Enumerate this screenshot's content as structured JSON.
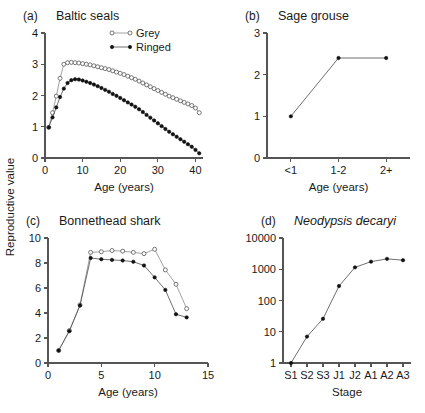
{
  "figure": {
    "shared_ylabel": "Reproductive value",
    "width": 425,
    "height": 413
  },
  "chart_data": [
    {
      "id": "a",
      "type": "line",
      "panel_letter": "(a)",
      "title": "Baltic seals",
      "title_italic": false,
      "xlabel": "Age (years)",
      "ylabel": "",
      "xlim": [
        0,
        42
      ],
      "ylim": [
        0,
        4
      ],
      "xticks": [
        0,
        10,
        20,
        30,
        40
      ],
      "xticklabels": [
        "0",
        "10",
        "20",
        "30",
        "40"
      ],
      "yticks": [
        0,
        1,
        2,
        3,
        4
      ],
      "yticklabels": [
        "0",
        "1",
        "2",
        "3",
        "4"
      ],
      "grid": false,
      "legend_position": "top-right",
      "series": [
        {
          "name": "Grey",
          "marker": "open-circle",
          "x": [
            1,
            2,
            3,
            4,
            5,
            6,
            7,
            8,
            9,
            10,
            11,
            12,
            13,
            14,
            15,
            16,
            17,
            18,
            19,
            20,
            21,
            22,
            23,
            24,
            25,
            26,
            27,
            28,
            29,
            30,
            31,
            32,
            33,
            34,
            35,
            36,
            37,
            38,
            39,
            40,
            41
          ],
          "values": [
            0.98,
            1.45,
            1.98,
            2.55,
            3.0,
            3.05,
            3.06,
            3.05,
            3.04,
            3.02,
            3.0,
            2.98,
            2.95,
            2.92,
            2.89,
            2.86,
            2.83,
            2.79,
            2.75,
            2.71,
            2.67,
            2.62,
            2.57,
            2.52,
            2.46,
            2.4,
            2.34,
            2.28,
            2.22,
            2.16,
            2.1,
            2.04,
            1.98,
            1.93,
            1.88,
            1.83,
            1.78,
            1.73,
            1.68,
            1.6,
            1.45
          ]
        },
        {
          "name": "Ringed",
          "marker": "filled-circle",
          "x": [
            1,
            2,
            3,
            4,
            5,
            6,
            7,
            8,
            9,
            10,
            11,
            12,
            13,
            14,
            15,
            16,
            17,
            18,
            19,
            20,
            21,
            22,
            23,
            24,
            25,
            26,
            27,
            28,
            29,
            30,
            31,
            32,
            33,
            34,
            35,
            36,
            37,
            38,
            39,
            40,
            41
          ],
          "values": [
            0.98,
            1.3,
            1.62,
            1.95,
            2.22,
            2.4,
            2.49,
            2.52,
            2.51,
            2.48,
            2.44,
            2.4,
            2.35,
            2.3,
            2.24,
            2.18,
            2.12,
            2.05,
            1.99,
            1.92,
            1.85,
            1.78,
            1.71,
            1.64,
            1.56,
            1.47,
            1.38,
            1.29,
            1.2,
            1.11,
            1.02,
            0.93,
            0.84,
            0.76,
            0.68,
            0.6,
            0.52,
            0.44,
            0.36,
            0.26,
            0.15
          ]
        }
      ]
    },
    {
      "id": "b",
      "type": "line",
      "panel_letter": "(b)",
      "title": "Sage grouse",
      "title_italic": false,
      "xlabel": "Age (years)",
      "ylabel": "",
      "ylim": [
        0,
        3
      ],
      "yticks": [
        0,
        1,
        2,
        3
      ],
      "yticklabels": [
        "0",
        "1",
        "2",
        "3"
      ],
      "categories": [
        "<1",
        "1-2",
        "2+"
      ],
      "grid": false,
      "series": [
        {
          "name": "Sage grouse",
          "marker": "filled-circle",
          "values": [
            1.0,
            2.4,
            2.4
          ]
        }
      ]
    },
    {
      "id": "c",
      "type": "line",
      "panel_letter": "(c)",
      "title": "Bonnethead shark",
      "title_italic": false,
      "xlabel": "Age (years)",
      "ylabel": "",
      "xlim": [
        0,
        15
      ],
      "ylim": [
        0,
        10
      ],
      "xticks": [
        0,
        5,
        10,
        15
      ],
      "xticklabels": [
        "0",
        "5",
        "10",
        "15"
      ],
      "yticks": [
        0,
        2,
        4,
        6,
        8,
        10
      ],
      "yticklabels": [
        "0",
        "2",
        "4",
        "6",
        "8",
        "10"
      ],
      "grid": false,
      "series": [
        {
          "name": "open",
          "marker": "open-circle",
          "x": [
            1,
            2,
            3,
            4,
            5,
            6,
            7,
            8,
            9,
            10,
            11,
            12,
            13
          ],
          "values": [
            1.0,
            2.6,
            4.65,
            8.85,
            8.9,
            9.0,
            8.95,
            8.85,
            8.75,
            9.1,
            7.45,
            6.3,
            4.35
          ]
        },
        {
          "name": "filled",
          "marker": "filled-circle",
          "x": [
            1,
            2,
            3,
            4,
            5,
            6,
            7,
            8,
            9,
            10,
            11,
            12,
            13
          ],
          "values": [
            1.0,
            2.55,
            4.6,
            8.4,
            8.3,
            8.25,
            8.2,
            8.1,
            7.8,
            6.85,
            5.85,
            3.9,
            3.65
          ]
        }
      ]
    },
    {
      "id": "d",
      "type": "line",
      "panel_letter": "(d)",
      "title": "Neodypsis decaryi",
      "title_italic": true,
      "xlabel": "Stage",
      "ylabel": "",
      "yscale": "log",
      "ylim": [
        1,
        10000
      ],
      "yticks": [
        1,
        10,
        100,
        1000,
        10000
      ],
      "yticklabels": [
        "1",
        "10",
        "100",
        "1000",
        "10000"
      ],
      "categories": [
        "S1",
        "S2",
        "S3",
        "J1",
        "J2",
        "A1",
        "A2",
        "A3"
      ],
      "grid": false,
      "series": [
        {
          "name": "Neodypsis decaryi",
          "marker": "filled-circle",
          "values": [
            1.0,
            7.0,
            26.0,
            290.0,
            1150.0,
            1750.0,
            2150.0,
            1950.0
          ]
        }
      ]
    }
  ]
}
